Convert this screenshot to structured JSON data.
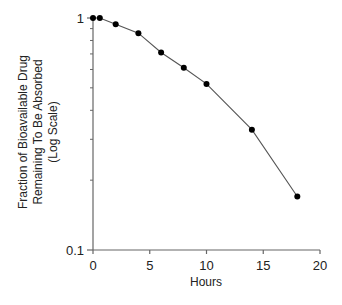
{
  "chart_data": {
    "type": "line",
    "title": "",
    "xlabel": "Hours",
    "ylabel_lines": [
      "Fraction of Bioavailable Drug",
      "Remaining To Be Absorbed",
      "(Log Scale)"
    ],
    "ylabel": "Fraction of Bioavailable Drug Remaining To Be Absorbed (Log Scale)",
    "xscale": "linear",
    "yscale": "log",
    "xlim": [
      0,
      20
    ],
    "ylim": [
      0.1,
      1
    ],
    "xticks": [
      0,
      5,
      10,
      15,
      20
    ],
    "xtick_labels": [
      "0",
      "5",
      "10",
      "15",
      "20"
    ],
    "yticks": [
      0.1,
      1
    ],
    "ytick_labels": [
      "0.1",
      "1"
    ],
    "grid": false,
    "legend": null,
    "series": [
      {
        "name": "Fraction remaining",
        "marker": "circle",
        "color": "#000000",
        "line_color": "#555555",
        "x": [
          0,
          0.6,
          2,
          4,
          6,
          8,
          10,
          14,
          18
        ],
        "y": [
          1.0,
          1.0,
          0.94,
          0.86,
          0.71,
          0.61,
          0.52,
          0.33,
          0.17
        ]
      }
    ]
  }
}
